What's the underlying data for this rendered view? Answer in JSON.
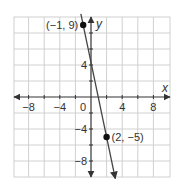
{
  "chart_data": {
    "type": "line",
    "title": "",
    "xlabel": "x",
    "ylabel": "y",
    "xlim": [
      -10,
      10
    ],
    "ylim": [
      -10,
      10
    ],
    "grid": true,
    "grid_step": 2,
    "x_ticks": [
      -8,
      -4,
      0,
      4,
      8
    ],
    "y_ticks": [
      4,
      -4,
      -8
    ],
    "x_tick_labels": [
      "−8",
      "−4",
      "0",
      "4",
      "8"
    ],
    "y_tick_labels": [
      "4",
      "−4",
      "−8"
    ],
    "origin_label": "0",
    "line": {
      "equation": "y = -14/3 x + 13/3",
      "through": [
        [
          -1,
          9
        ],
        [
          2,
          -5
        ]
      ],
      "slope": -4.6667,
      "y_intercept": 4.3333
    },
    "points": [
      {
        "x": -1,
        "y": 9,
        "label": "(−1, 9)"
      },
      {
        "x": 2,
        "y": -5,
        "label": "(2, −5)"
      }
    ]
  },
  "colors": {
    "grid": "#d0d0d0",
    "axis": "#333333",
    "line": "#444444",
    "point": "#111111",
    "background": "#ffffff"
  }
}
